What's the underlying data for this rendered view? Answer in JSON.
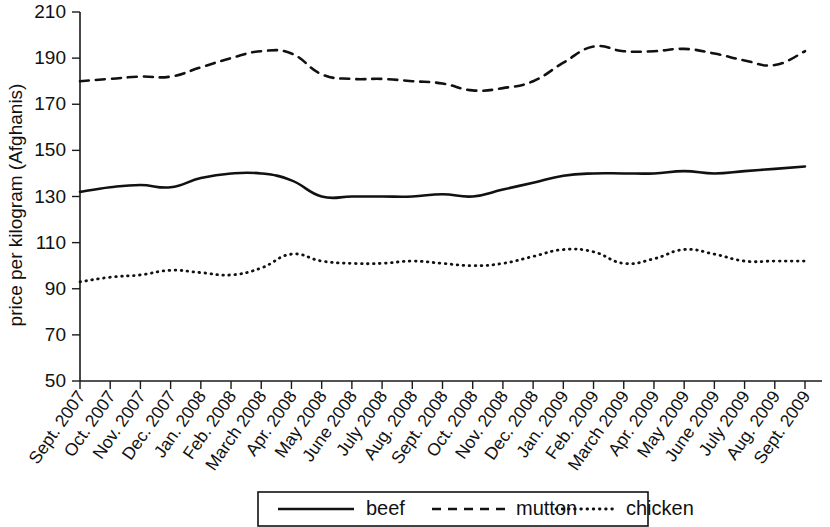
{
  "chart_data": {
    "type": "line",
    "title": "",
    "xlabel": "",
    "ylabel": "price per kilogram (Afghanis)",
    "ylim": [
      50,
      210
    ],
    "yticks": [
      50,
      70,
      90,
      110,
      130,
      150,
      170,
      190,
      210
    ],
    "grid": false,
    "legend_position": "bottom",
    "categories": [
      "Sept. 2007",
      "Oct. 2007",
      "Nov. 2007",
      "Dec. 2007",
      "Jan. 2008",
      "Feb. 2008",
      "March 2008",
      "Apr. 2008",
      "May 2008",
      "June 2008",
      "July 2008",
      "Aug. 2008",
      "Sept. 2008",
      "Oct. 2008",
      "Nov. 2008",
      "Dec. 2008",
      "Jan. 2009",
      "Feb. 2009",
      "March 2009",
      "Apr. 2009",
      "May 2009",
      "June 2009",
      "July 2009",
      "Aug. 2009",
      "Sept. 2009"
    ],
    "series": [
      {
        "name": "beef",
        "style": "solid",
        "values": [
          132,
          134,
          135,
          134,
          138,
          140,
          140,
          137,
          130,
          130,
          130,
          130,
          131,
          130,
          133,
          136,
          139,
          140,
          140,
          140,
          141,
          140,
          141,
          142,
          143
        ]
      },
      {
        "name": "mutton",
        "style": "dashed",
        "values": [
          180,
          181,
          182,
          182,
          186,
          190,
          193,
          192,
          183,
          181,
          181,
          180,
          179,
          176,
          177,
          180,
          188,
          195,
          193,
          193,
          194,
          192,
          189,
          187,
          193
        ]
      },
      {
        "name": "chicken",
        "style": "dotted",
        "values": [
          93,
          95,
          96,
          98,
          97,
          96,
          99,
          105,
          102,
          101,
          101,
          102,
          101,
          100,
          101,
          104,
          107,
          106,
          101,
          103,
          107,
          105,
          102,
          102,
          102
        ]
      }
    ],
    "legend": [
      {
        "label": "beef",
        "style": "solid"
      },
      {
        "label": "mutton",
        "style": "dashed"
      },
      {
        "label": "chicken",
        "style": "dotted"
      }
    ]
  },
  "colors": {
    "ink": "#111111",
    "background": "#ffffff"
  }
}
